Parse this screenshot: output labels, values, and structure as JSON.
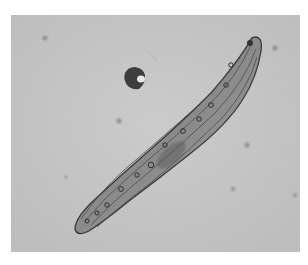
{
  "image": {
    "kind": "brightfield micrograph",
    "subject": "elongated spindle-shaped ciliate cell",
    "grayscale": true,
    "colors": {
      "background": "#c4c4c4",
      "frame": "#ffffff",
      "cell_body": "#8e8e8e",
      "cell_outline": "#3a3a3a",
      "particle": "#2e2e2e"
    }
  }
}
